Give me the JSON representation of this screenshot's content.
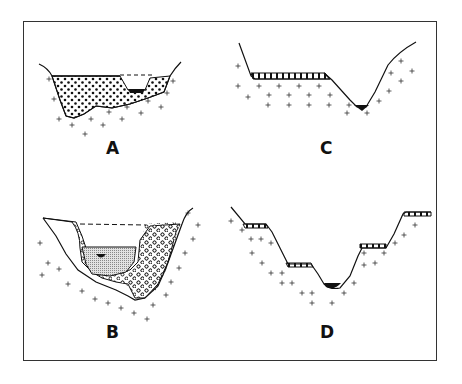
{
  "figure": {
    "panels": [
      {
        "id": "A",
        "label": "A",
        "description": "Valley cross-section filled with alluvial gravel (dotted fill) over bedrock (crosses), small black stream channel, dashed flood-level line"
      },
      {
        "id": "B",
        "label": "B",
        "description": "Valley with older gravel fill (circles) cut into and partly refilled with finer sediment (stippled), small black channel, dashed former surface line"
      },
      {
        "id": "C",
        "label": "C",
        "description": "Single terrace remnant (banded) on left bench, V-shaped incised valley with black stream at bottom, bedrock crosses"
      },
      {
        "id": "D",
        "label": "D",
        "description": "Paired stepped terraces (banded) on both valley walls, black stream channel at bottom, bedrock crosses"
      }
    ],
    "legend_patterns": {
      "bedrock": "cross",
      "gravel_fill": "dots",
      "fine_fill": "stipple",
      "stream": "solid-black",
      "terrace_deposit": "banded"
    },
    "colors": {
      "line": "#111111",
      "background": "#ffffff",
      "stipple": "#c8c8c8"
    }
  }
}
